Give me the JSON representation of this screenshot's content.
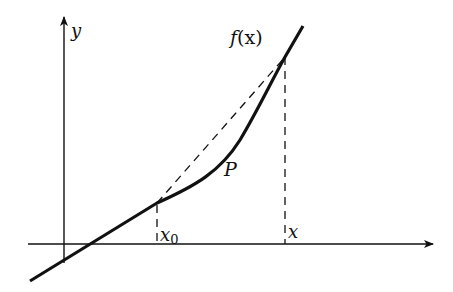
{
  "diagram": {
    "colors": {
      "background": "#ffffff",
      "stroke": "#111111"
    },
    "axes": {
      "y_label": "y",
      "x_axis_has_arrow": true,
      "y_axis_has_arrow": true
    },
    "labels": {
      "function": "f(x)",
      "function_name": "f",
      "function_arg": "(x)",
      "point": "P",
      "x0_base": "x",
      "x0_sub": "0",
      "x": "x"
    },
    "elements": [
      {
        "type": "axis",
        "name": "x-axis"
      },
      {
        "type": "axis",
        "name": "y-axis"
      },
      {
        "type": "curve",
        "name": "f(x)",
        "style": "solid-thick"
      },
      {
        "type": "line",
        "name": "secant",
        "from": "x0",
        "to": "x",
        "style": "dashed"
      },
      {
        "type": "line",
        "name": "vertical-at-x",
        "style": "dashed"
      },
      {
        "type": "line",
        "name": "vertical-at-x0",
        "style": "dashed"
      }
    ]
  }
}
